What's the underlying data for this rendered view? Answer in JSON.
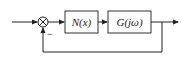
{
  "diagram": {
    "type": "feedback-block-diagram",
    "summing_junction": {
      "symbol": "⊗",
      "feedback_sign": "−"
    },
    "blocks": [
      {
        "id": "nonlinear",
        "label": "N(x)"
      },
      {
        "id": "plant",
        "label": "G(jω)"
      }
    ],
    "connections": [
      "input → summing junction",
      "summing junction → N(x)",
      "N(x) → G(jω)",
      "G(jω) → output",
      "output → feedback → summing junction (−)"
    ]
  }
}
